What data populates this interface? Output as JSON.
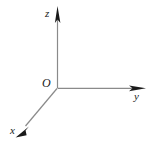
{
  "figure": {
    "background_color": "#ffffff",
    "line_color": "#8a8a8a",
    "arrow_color": "#1a1a1a",
    "label_color": "#1a1a1a",
    "width": 149,
    "height": 149
  },
  "origin": {
    "label": "O",
    "x": 57,
    "y": 88
  },
  "axes": [
    {
      "name": "z",
      "label": "z",
      "direction": "up",
      "start": {
        "x": 57,
        "y": 88
      },
      "end": {
        "x": 57,
        "y": 7
      },
      "label_position": {
        "x": 45,
        "y": 8
      },
      "arrowhead": true
    },
    {
      "name": "y",
      "label": "y",
      "direction": "right",
      "start": {
        "x": 57,
        "y": 88
      },
      "end": {
        "x": 145,
        "y": 88
      },
      "label_position": {
        "x": 134,
        "y": 91
      },
      "arrowhead": true
    },
    {
      "name": "x",
      "label": "x",
      "direction": "down-left",
      "start": {
        "x": 57,
        "y": 88
      },
      "end": {
        "x": 16,
        "y": 137
      },
      "label_position": {
        "x": 10,
        "y": 125
      },
      "arrowhead": true
    }
  ]
}
